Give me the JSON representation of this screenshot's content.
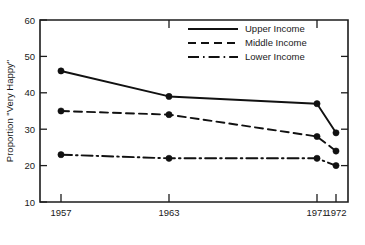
{
  "chart_data": {
    "type": "line",
    "title": "",
    "subtitle": "",
    "xlabel": "",
    "ylabel": "Proportion \"Very Happy\"",
    "x": [
      1957,
      1963,
      1971,
      1972
    ],
    "categories": [
      "1957",
      "1963",
      "1971",
      "1972"
    ],
    "xtick_labels": [
      "1957",
      "1963",
      "1971",
      "1972"
    ],
    "ytick_labels": [
      "60",
      "50",
      "40",
      "30",
      "20",
      "10"
    ],
    "ytick_values": [
      60,
      50,
      40,
      30,
      20,
      10
    ],
    "ylim": [
      10,
      60
    ],
    "xlim": [
      1955.2,
      1973.6
    ],
    "grid": false,
    "legend_position": "top-right",
    "series": [
      {
        "name": "Upper Income",
        "style": "solid",
        "values": [
          46,
          39,
          37,
          29
        ]
      },
      {
        "name": "Middle Income",
        "style": "dashed",
        "values": [
          35,
          34,
          28,
          24
        ]
      },
      {
        "name": "Lower Income",
        "style": "dashdot",
        "values": [
          23,
          22,
          22,
          20
        ]
      }
    ],
    "colors": {
      "line": "#111111",
      "axis": "#1c1c1c",
      "text": "#1a1a1a",
      "background": "#ffffff"
    }
  },
  "legend": {
    "items": [
      {
        "label": "Upper Income",
        "style": "solid"
      },
      {
        "label": "Middle Income",
        "style": "dashed"
      },
      {
        "label": "Lower Income",
        "style": "dashdot"
      }
    ]
  },
  "axes": {
    "y_title": "Proportion \"Very Happy\"",
    "y_ticks": [
      "60",
      "50",
      "40",
      "30",
      "20",
      "10"
    ],
    "x_ticks": [
      "1957",
      "1963",
      "1971",
      "1972"
    ]
  }
}
